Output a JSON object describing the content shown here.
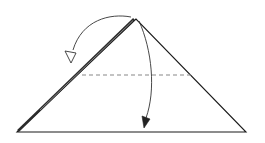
{
  "diagram": {
    "type": "origami-fold-step",
    "colors": {
      "background": "#ffffff",
      "outline": "#1a1a1a",
      "fold_line": "#888888",
      "front_edge": "#2b2b2b"
    },
    "shapes": {
      "triangle": {
        "apex": [
          136,
          19
        ],
        "left": [
          17,
          132
        ],
        "right": [
          246,
          132
        ]
      },
      "valley_fold_line": {
        "x1": 82,
        "y1": 75,
        "x2": 192,
        "y2": 75,
        "style": "dashed"
      },
      "left_layer_edge": {
        "x1": 131,
        "y1": 20,
        "x2": 18,
        "y2": 131
      }
    },
    "arrows": [
      {
        "name": "fold-back-arrow",
        "meaning": "fold layer behind to the left",
        "head": "hollow"
      },
      {
        "name": "fold-down-arrow",
        "meaning": "fold apex down along dashed line",
        "head": "filled"
      }
    ]
  }
}
